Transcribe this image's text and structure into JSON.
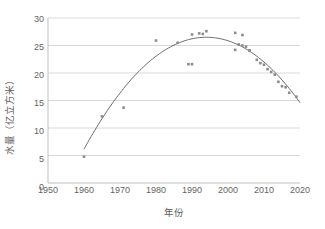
{
  "chart_data": {
    "type": "scatter",
    "title": "",
    "xlabel": "年份",
    "ylabel": "水量（亿立方米）",
    "xlim": [
      1950,
      2020
    ],
    "ylim": [
      0,
      30
    ],
    "xticks": [
      1950,
      1960,
      1970,
      1980,
      1990,
      2000,
      2010,
      2020
    ],
    "yticks": [
      0,
      5,
      10,
      15,
      20,
      25,
      30
    ],
    "grid": "horizontal",
    "legend": "none",
    "marker": "square",
    "marker_color": "#8c8c8c",
    "trend_color": "#6e6e6e",
    "series": [
      {
        "name": "观测水量",
        "marker": "square",
        "points": [
          {
            "x": 1960,
            "y": 4.8
          },
          {
            "x": 1965,
            "y": 12.1
          },
          {
            "x": 1971,
            "y": 13.7
          },
          {
            "x": 1980,
            "y": 25.9
          },
          {
            "x": 1986,
            "y": 25.5
          },
          {
            "x": 1989,
            "y": 21.6
          },
          {
            "x": 1990,
            "y": 21.6
          },
          {
            "x": 1990,
            "y": 27.0
          },
          {
            "x": 1992,
            "y": 27.2
          },
          {
            "x": 1993,
            "y": 27.1
          },
          {
            "x": 1994,
            "y": 27.6
          },
          {
            "x": 2002,
            "y": 27.3
          },
          {
            "x": 2002,
            "y": 24.2
          },
          {
            "x": 2003,
            "y": 25.2
          },
          {
            "x": 2004,
            "y": 26.9
          },
          {
            "x": 2004,
            "y": 25.0
          },
          {
            "x": 2005,
            "y": 24.8
          },
          {
            "x": 2006,
            "y": 24.1
          },
          {
            "x": 2006,
            "y": 24.1
          },
          {
            "x": 2008,
            "y": 22.4
          },
          {
            "x": 2009,
            "y": 21.8
          },
          {
            "x": 2010,
            "y": 21.5
          },
          {
            "x": 2011,
            "y": 20.7
          },
          {
            "x": 2012,
            "y": 20.2
          },
          {
            "x": 2013,
            "y": 19.7
          },
          {
            "x": 2014,
            "y": 18.4
          },
          {
            "x": 2015,
            "y": 17.6
          },
          {
            "x": 2016,
            "y": 17.4
          },
          {
            "x": 2017,
            "y": 16.4
          },
          {
            "x": 2019,
            "y": 15.7
          }
        ]
      }
    ],
    "trendline": {
      "name": "二次拟合曲线",
      "type": "quadratic",
      "x_start": 1960,
      "x_end": 2020,
      "peak_x": 1994,
      "peak_y": 26.5,
      "y_at_x_start": 4.6,
      "y_at_x_end": 14.6
    }
  }
}
